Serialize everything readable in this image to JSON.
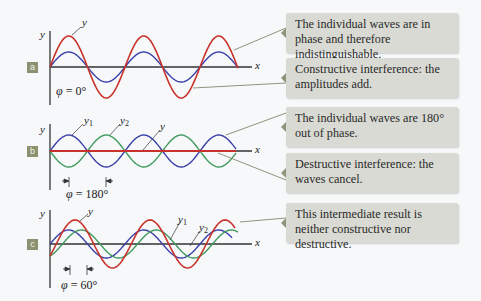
{
  "colors": {
    "background": "#f6f8fa",
    "resultant_wave": "#c8322a",
    "wave_y1": "#3a3fa8",
    "wave_y2": "#3f9a5c",
    "axis": "#333333",
    "callout_bg": "#d9dad3",
    "leader_line": "#8f957a",
    "panel_label_bg": "#8c916f"
  },
  "panels": [
    {
      "id": "a",
      "label": "a",
      "axis_y_label": "y",
      "axis_x_label": "x",
      "phase_symbol": "φ",
      "phase_text": " = 0°",
      "curve_labels": {
        "y": "y"
      },
      "callouts": [
        "The individual waves are in phase and therefore indistinguishable.",
        "Constructive interference: the amplitudes add."
      ]
    },
    {
      "id": "b",
      "label": "b",
      "axis_y_label": "y",
      "axis_x_label": "x",
      "phase_symbol": "φ",
      "phase_text": " = 180°",
      "curve_labels": {
        "y1": "y",
        "y1_sub": "1",
        "y2": "y",
        "y2_sub": "2",
        "y": "y"
      },
      "callouts": [
        "The individual waves are 180° out of phase.",
        "Destructive interference: the waves cancel."
      ]
    },
    {
      "id": "c",
      "label": "c",
      "axis_y_label": "y",
      "axis_x_label": "x",
      "phase_symbol": "φ",
      "phase_text": " = 60°",
      "curve_labels": {
        "y": "y",
        "y1": "y",
        "y1_sub": "1",
        "y2": "y",
        "y2_sub": "2"
      },
      "callouts": [
        "This intermediate result is neither constructive nor destructive."
      ]
    }
  ]
}
